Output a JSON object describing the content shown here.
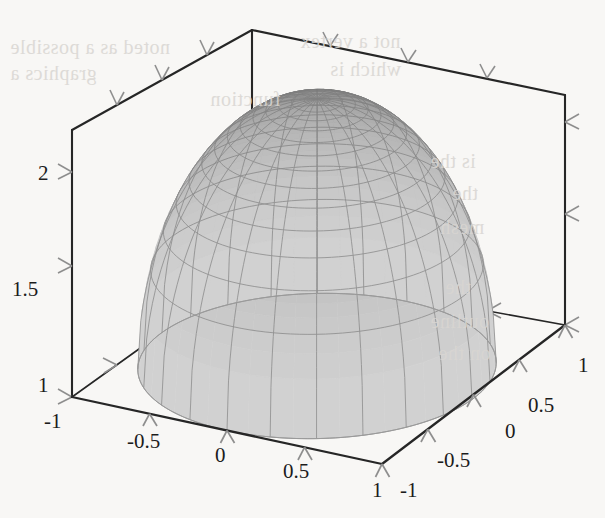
{
  "figure": {
    "kind": "3d-surface-plot",
    "background_color": "#f8f7f5",
    "axis_color": "#262626",
    "tick_color": "#8a8a8a",
    "mesh_line_color": "#777777",
    "surface_dark": "#6a6a6a",
    "surface_light": "#d2d2d2",
    "title": ""
  },
  "chart_data": {
    "type": "surface",
    "title": "",
    "xlabel": "",
    "ylabel": "",
    "zlabel": "",
    "xlim": [
      -1,
      1
    ],
    "ylim": [
      -1,
      1
    ],
    "zlim": [
      1,
      2
    ],
    "grid": true,
    "legend": "none",
    "projection": "3d-box",
    "mesh": {
      "radial_lines": 24,
      "rings": 14,
      "shading": "grayscale-height"
    },
    "surface_description": "Dome (paraboloid-like cap) over the unit disk, z = 1 + sqrt(1 - x^2 - y^2) style cap, peak z = 2 at (0,0), skirt down to z = 1 at the disk boundary",
    "x_axis": {
      "label": "",
      "ticks": [
        -1,
        -0.5,
        0,
        0.5,
        1
      ],
      "tick_labels": [
        "-1",
        "-0.5",
        "0",
        "0.5",
        "1"
      ]
    },
    "y_axis": {
      "label": "",
      "ticks": [
        -1,
        -0.5,
        0,
        0.5,
        1
      ],
      "tick_labels": [
        "-1",
        "-0.5",
        "0",
        "0.5",
        "1"
      ]
    },
    "z_axis": {
      "label": "",
      "ticks": [
        1,
        1.5,
        2
      ],
      "tick_labels": [
        "1",
        "1.5",
        "2"
      ]
    }
  },
  "axes": {
    "x_tick_labels": [
      {
        "text": "-1",
        "x": 44,
        "y": 428
      },
      {
        "text": "-0.5",
        "x": 127,
        "y": 448
      },
      {
        "text": "0",
        "x": 215,
        "y": 462
      },
      {
        "text": "0.5",
        "x": 283,
        "y": 478
      },
      {
        "text": "1",
        "x": 372,
        "y": 497
      }
    ],
    "y_tick_labels": [
      {
        "text": "-1",
        "x": 400,
        "y": 497
      },
      {
        "text": "-0.5",
        "x": 437,
        "y": 467
      },
      {
        "text": "0",
        "x": 505,
        "y": 438
      },
      {
        "text": "0.5",
        "x": 528,
        "y": 412
      },
      {
        "text": "1",
        "x": 578,
        "y": 372
      }
    ],
    "z_tick_labels": [
      {
        "text": "2",
        "x": 38,
        "y": 180
      },
      {
        "text": "1.5",
        "x": 12,
        "y": 296
      },
      {
        "text": "1",
        "x": 38,
        "y": 392
      }
    ]
  },
  "scan_artifacts": {
    "note": "faint mirrored bleed-through text from the reverse side of the printed page",
    "ghost_lines": [
      {
        "text": "noted as a possible",
        "x": 10,
        "y": 36,
        "size": 20
      },
      {
        "text": "not a vertex",
        "x": 300,
        "y": 30,
        "size": 20
      },
      {
        "text": "graphics a",
        "x": 10,
        "y": 62,
        "size": 20
      },
      {
        "text": "which is",
        "x": 330,
        "y": 58,
        "size": 20
      },
      {
        "text": "function",
        "x": 210,
        "y": 88,
        "size": 20
      },
      {
        "text": "is the",
        "x": 430,
        "y": 150,
        "size": 20
      },
      {
        "text": "the",
        "x": 452,
        "y": 182,
        "size": 20
      },
      {
        "text": "mesh",
        "x": 440,
        "y": 216,
        "size": 20
      },
      {
        "text": "the",
        "x": 445,
        "y": 276,
        "size": 20
      },
      {
        "text": "outline",
        "x": 430,
        "y": 310,
        "size": 20
      },
      {
        "text": "on the",
        "x": 438,
        "y": 342,
        "size": 20
      }
    ]
  }
}
